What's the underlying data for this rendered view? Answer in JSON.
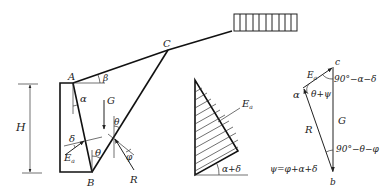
{
  "figure": {
    "type": "retaining-wall Coulomb active earth pressure diagram",
    "wall_section": {
      "points": {
        "A": "A",
        "B": "B",
        "C": "C"
      },
      "labels": {
        "height": "H",
        "beta": "β",
        "alpha": "α",
        "weight": "G",
        "delta": "δ",
        "theta": "θ",
        "theta2": "θ",
        "phi": "φ",
        "force_Ea": "E",
        "force_Ea_sub": "a",
        "reaction": "R"
      }
    },
    "pressure_distribution": {
      "labels": {
        "force_Ea": "E",
        "force_Ea_sub": "a",
        "angle": "α+δ"
      }
    },
    "force_polygon": {
      "vertices": {
        "a": "α",
        "b": "b",
        "c": "c"
      },
      "labels": {
        "force_Ea": "E",
        "force_Ea_sub": "a",
        "weight": "G",
        "reaction": "R",
        "angle_a": "θ+ψ",
        "angle_c": "90°−α−δ",
        "angle_b": "90°−θ−φ",
        "psi_def": "ψ=φ+α+δ"
      }
    }
  }
}
